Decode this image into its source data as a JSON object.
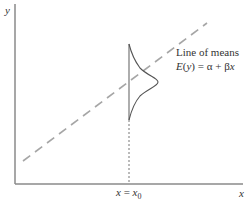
{
  "diagram": {
    "axes": {
      "y_label": "y",
      "x_label": "x",
      "x0_label_prefix": "x = x",
      "x0_label_sub": "0"
    },
    "annotation": {
      "line1": "Line of means",
      "line2_lhs": "E(y) = ",
      "line2_rhs": "α + βx"
    },
    "colors": {
      "axis": "#888888",
      "dashed_line": "#a6a6a6",
      "curve": "#555555",
      "text": "#333333"
    }
  }
}
